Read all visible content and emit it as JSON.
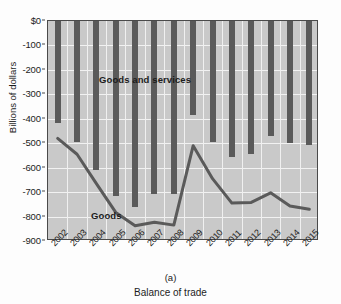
{
  "figure": {
    "panel_letter": "(a)",
    "x_axis_title": "Balance of trade",
    "y_axis_title": "Billions of dollars"
  },
  "axis": {
    "y_ticks": [
      "$0",
      "-100",
      "-200",
      "-300",
      "-400",
      "-500",
      "-600",
      "-700",
      "-800",
      "-900"
    ],
    "y_values": [
      0,
      -100,
      -200,
      -300,
      -400,
      -500,
      -600,
      -700,
      -800,
      -900
    ]
  },
  "labels": {
    "goods_and_services": "Goods and services",
    "goods": "Goods"
  },
  "colors": {
    "plot_background": "#c9c9c9",
    "gridline": "#f2f2f2",
    "bar": "#5a5a5a",
    "line": "#5a5a5a",
    "axis": "#4a4a4a",
    "text": "#1c1c1c"
  },
  "chart_data": {
    "type": "bar",
    "title": "",
    "subtitle": "",
    "xlabel": "Balance of trade",
    "ylabel": "Billions of dollars",
    "ylim": [
      -900,
      0
    ],
    "yticks": [
      0,
      -100,
      -200,
      -300,
      -400,
      -500,
      -600,
      -700,
      -800,
      -900
    ],
    "grid": true,
    "legend": "inline-annotations",
    "categories": [
      "2002",
      "2003",
      "2004",
      "2005",
      "2006",
      "2007",
      "2008",
      "2009",
      "2010",
      "2011",
      "2012",
      "2013",
      "2014",
      "2015"
    ],
    "series": [
      {
        "name": "Goods and services",
        "type": "bar",
        "values": [
          -418,
          -495,
          -610,
          -715,
          -762,
          -706,
          -709,
          -384,
          -495,
          -556,
          -543,
          -472,
          -500,
          -508
        ]
      },
      {
        "name": "Goods",
        "type": "line",
        "values": [
          -480,
          -545,
          -665,
          -783,
          -838,
          -823,
          -835,
          -510,
          -645,
          -745,
          -742,
          -703,
          -757,
          -770
        ]
      }
    ],
    "annotations": [
      {
        "text": "Goods and services",
        "near_year": "2004"
      },
      {
        "text": "Goods",
        "near_year": "2006"
      }
    ]
  }
}
